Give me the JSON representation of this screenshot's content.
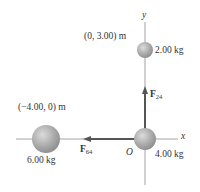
{
  "axes": {
    "x_label": "x",
    "y_label": "y",
    "origin_label": "O"
  },
  "masses": [
    {
      "id": "m2",
      "mass_label": "2.00 kg",
      "position_label": "(0, 3.00) m"
    },
    {
      "id": "m4",
      "mass_label": "4.00 kg"
    },
    {
      "id": "m6",
      "mass_label": "6.00 kg",
      "position_label": "(−4.00, 0) m"
    }
  ],
  "forces": [
    {
      "id": "F24",
      "symbol": "F",
      "subscript": "24",
      "direction": "up"
    },
    {
      "id": "F64",
      "symbol": "F",
      "subscript": "64",
      "direction": "left"
    }
  ],
  "colors": {
    "axis": "#8a8a8a",
    "vector": "#555555",
    "sphere": "#a8a8a8"
  }
}
